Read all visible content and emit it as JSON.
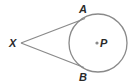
{
  "diagram": {
    "type": "geometry-tangents-to-circle",
    "circle": {
      "center_label": "P",
      "cx": 98,
      "cy": 43,
      "r": 29
    },
    "points": {
      "X": {
        "label": "X",
        "x": 21,
        "y": 43
      },
      "A": {
        "label": "A",
        "x": 85,
        "y": 19
      },
      "B": {
        "label": "B",
        "x": 84,
        "y": 67
      }
    },
    "segments": [
      {
        "from": "X",
        "to": "A",
        "name": "tangent-XA"
      },
      {
        "from": "X",
        "to": "B",
        "name": "tangent-XB"
      }
    ],
    "colors": {
      "stroke": "#8a8a8a",
      "label": "#2a2a2a",
      "center_dot": "#8a8a8a"
    }
  }
}
